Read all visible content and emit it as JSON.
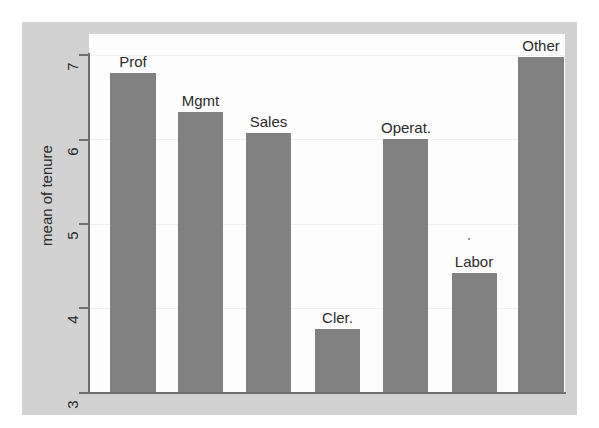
{
  "chart_data": {
    "type": "bar",
    "title": "",
    "xlabel": "",
    "ylabel": "mean of tenure",
    "ylim": [
      3,
      7
    ],
    "yticks": [
      "3",
      "4",
      "5",
      "6",
      "7"
    ],
    "grid": true,
    "legend": "none",
    "bar_color": "#818181",
    "panel_color": "#d2d2d2",
    "plot_background": "#fdfdfd",
    "axis_color": "#6f6f6f",
    "categories": [
      "Prof",
      "Mgmt",
      "Sales",
      "Cler.",
      "Operat.",
      "Labor",
      "Other"
    ],
    "values": [
      6.78,
      6.31,
      6.06,
      3.74,
      5.99,
      4.41,
      6.96
    ],
    "bars": [
      {
        "label": "Prof",
        "value": 6.78
      },
      {
        "label": "Mgmt",
        "value": 6.31
      },
      {
        "label": "Sales",
        "value": 6.06
      },
      {
        "label": "Cler.",
        "value": 3.74
      },
      {
        "label": "Operat.",
        "value": 5.99
      },
      {
        "label": "Labor",
        "value": 4.41
      },
      {
        "label": "Other",
        "value": 6.96
      }
    ]
  },
  "cropped_caption": ""
}
